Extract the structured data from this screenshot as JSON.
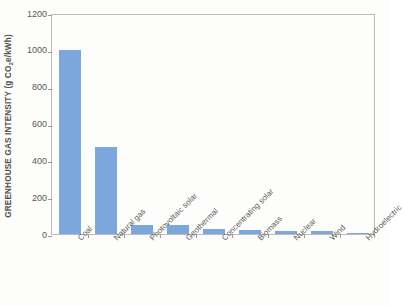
{
  "chart_data": {
    "type": "bar",
    "title": "",
    "xlabel": "",
    "ylabel": "GREENHOUSE GAS INTENSITY (g CO2e/kWh)",
    "ylabel_parts": {
      "before": "GREENHOUSE GAS INTENSITY (g CO",
      "sub": "2",
      "after": "e/kWh)"
    },
    "categories": [
      "Coal",
      "Natural gas",
      "Photovoltaic solar",
      "Geothermal",
      "Concentrating solar",
      "Biomass",
      "Nuclear",
      "Wind",
      "Hydroelectric"
    ],
    "values": [
      1000,
      470,
      48,
      48,
      26,
      24,
      18,
      15,
      5
    ],
    "ylim": [
      0,
      1200
    ],
    "yticks": [
      0,
      200,
      400,
      600,
      800,
      1000,
      1200
    ],
    "ytick_labels": [
      "0",
      "200",
      "400",
      "600",
      "800",
      "1000",
      "1200"
    ],
    "grid": false,
    "legend": null,
    "bar_color": "#7ba7dc",
    "axis_color": "#bdbcba",
    "text_color": "#5b5957"
  }
}
